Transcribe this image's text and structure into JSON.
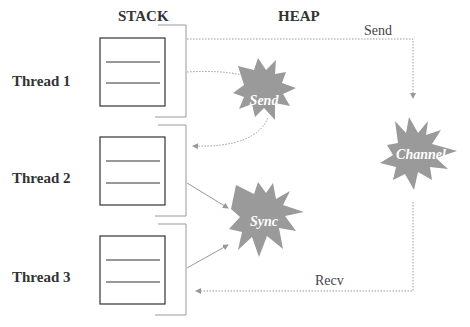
{
  "diagram": {
    "columns": {
      "stack": "STACK",
      "heap": "HEAP"
    },
    "threads": [
      {
        "label": "Thread 1"
      },
      {
        "label": "Thread 2"
      },
      {
        "label": "Thread 3"
      }
    ],
    "heap_objects": [
      {
        "label": "Send"
      },
      {
        "label": "Sync"
      },
      {
        "label": "Channel"
      }
    ],
    "edges": {
      "send_label": "Send",
      "recv_label": "Recv"
    },
    "colors": {
      "burst": "#9a9a9a",
      "line": "#999999",
      "box": "#333333"
    }
  }
}
